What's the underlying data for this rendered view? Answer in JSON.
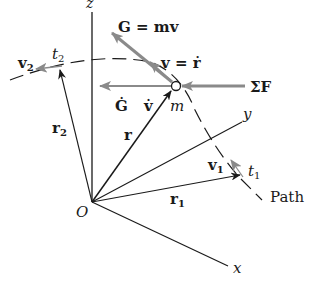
{
  "diagram": {
    "colors": {
      "ink": "#1a1a1a",
      "gray_vector": "#8a8a8a",
      "background": "#ffffff"
    },
    "axes": {
      "z": "z",
      "y": "y",
      "x": "x",
      "origin": "O"
    },
    "labels": {
      "momentum": "G = mv",
      "velocity": "v = ṙ",
      "momentum_rate": "Ġ",
      "accel": "v̇",
      "mass": "m",
      "force": "ΣF",
      "position": "r",
      "position1": "r",
      "position1_sub": "1",
      "position2": "r",
      "position2_sub": "2",
      "velocity1": "v",
      "velocity1_sub": "1",
      "velocity2": "v",
      "velocity2_sub": "2",
      "time1": "t",
      "time1_sub": "1",
      "time2": "t",
      "time2_sub": "2",
      "path": "Path"
    }
  }
}
